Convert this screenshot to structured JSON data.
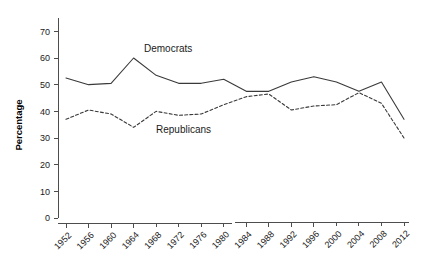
{
  "chart_data": {
    "type": "line",
    "title": "",
    "xlabel": "",
    "ylabel": "Percentage",
    "categories": [
      "1952",
      "1956",
      "1960",
      "1964",
      "1968",
      "1972",
      "1976",
      "1980",
      "1984",
      "1988",
      "1992",
      "1996",
      "2000",
      "2004",
      "2008",
      "2012"
    ],
    "ylim": [
      0,
      75
    ],
    "yticks": [
      0,
      10,
      20,
      30,
      40,
      50,
      60,
      70
    ],
    "ytick_labels": [
      "0",
      "10",
      "20",
      "30",
      "40",
      "50",
      "60",
      "70"
    ],
    "grid": false,
    "legend_position": "inline-annotations",
    "series": [
      {
        "name": "Democrats",
        "style": "solid",
        "color": "#3a3a3a",
        "values": [
          52.5,
          50.0,
          50.5,
          60.0,
          53.5,
          50.5,
          50.5,
          52.0,
          47.5,
          47.5,
          51.0,
          53.0,
          51.0,
          47.5,
          51.0,
          37.0
        ]
      },
      {
        "name": "Republicans",
        "style": "dashed",
        "color": "#3a3a3a",
        "values": [
          37.0,
          40.5,
          39.0,
          34.0,
          40.0,
          38.5,
          39.0,
          42.5,
          45.5,
          46.5,
          40.5,
          42.0,
          42.5,
          47.0,
          43.0,
          30.0
        ]
      }
    ],
    "annotations": [
      {
        "text": "Democrats",
        "x_value": 1966,
        "y_value": 58.5
      },
      {
        "text": "Republicans",
        "x_value": 1970,
        "y_value": 33.5
      }
    ]
  }
}
